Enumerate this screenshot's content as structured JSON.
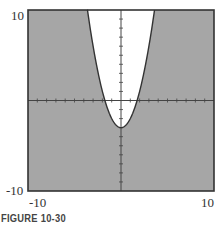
{
  "figure": {
    "caption": "FIGURE 10-30"
  },
  "chart_data": {
    "type": "area",
    "title": "",
    "function": "y = x^2 - 3",
    "vertex": [
      0,
      -3
    ],
    "x_intercepts": [
      -1.73,
      1.73
    ],
    "xlim": [
      -10,
      10
    ],
    "ylim": [
      -10,
      10
    ],
    "x_tick_labels": [
      "-10",
      "10"
    ],
    "y_tick_labels": [
      "10",
      "-10"
    ],
    "tick_interval": 1,
    "grid": false,
    "shaded_color": "#a6a6a6",
    "unshaded_color": "#ffffff",
    "xlabel": "",
    "ylabel": ""
  },
  "labels": {
    "y_max": "10",
    "y_min": "-10",
    "x_min": "-10",
    "x_max": "10"
  }
}
